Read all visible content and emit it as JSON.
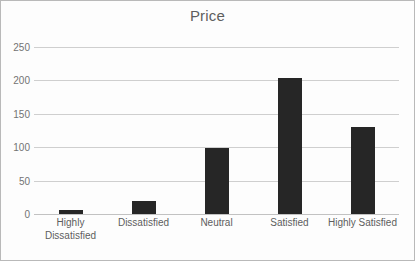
{
  "chart_data": {
    "type": "bar",
    "title": "Price",
    "xlabel": "",
    "ylabel": "",
    "categories": [
      "Highly Dissatisfied",
      "Dissatisfied",
      "Neutral",
      "Satisfied",
      "Highly Satisfied"
    ],
    "values": [
      6,
      20,
      99,
      203,
      130
    ],
    "ylim": [
      0,
      250
    ],
    "yticks": [
      0,
      50,
      100,
      150,
      200,
      250
    ],
    "ytick_labels": [
      "0",
      "50",
      "100",
      "150",
      "200",
      "250"
    ],
    "grid": true,
    "legend": false,
    "series": [
      {
        "name": "Price",
        "values": [
          6,
          20,
          99,
          203,
          130
        ]
      }
    ],
    "colors": {
      "bar": "#262626",
      "gridline": "#cfcfcf",
      "title_text": "#5e5e5e",
      "tick_text": "#737373",
      "category_text": "#5e5e5e",
      "plot_background": "#fdfdfd",
      "frame_border": "#b9b9b9"
    }
  }
}
